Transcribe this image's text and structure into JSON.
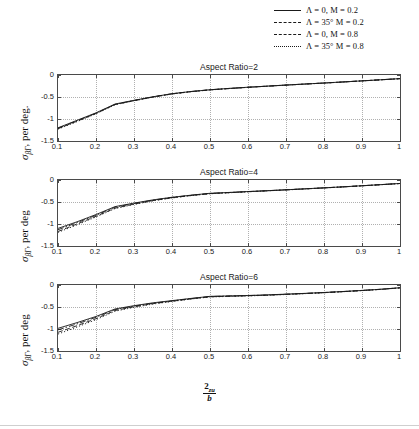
{
  "legend": {
    "position": "top-right",
    "entries": [
      {
        "label": "Λ = 0,   M = 0.2",
        "style": "solid"
      },
      {
        "label": "Λ = 35° M = 0.2",
        "style": "dashed"
      },
      {
        "label": "Λ = 0,   M = 0.8",
        "style": "dashdot"
      },
      {
        "label": "Λ = 35° M = 0.8",
        "style": "dotted"
      }
    ]
  },
  "axis": {
    "ylabel": "σβΓ, per deg.",
    "xlabel_numerator": "2z_u",
    "xlabel_denominator": "b",
    "xticklabels": [
      "0.1",
      "0.2",
      "0.3",
      "0.4",
      "0.5",
      "0.6",
      "0.7",
      "0.8",
      "0.9",
      "1"
    ],
    "yticklabels": [
      "0",
      "-0.5",
      "-1",
      "-1.5"
    ]
  },
  "chart_data": [
    {
      "type": "line",
      "title": "Aspect Ratio=2",
      "xlabel": "2z_u/b",
      "ylabel": "σβΓ, per deg.",
      "xlim": [
        0.1,
        1.0
      ],
      "ylim": [
        -1.5,
        0
      ],
      "xticks": [
        0.1,
        0.2,
        0.3,
        0.4,
        0.5,
        0.6,
        0.7,
        0.8,
        0.9,
        1.0
      ],
      "yticks": [
        0,
        -0.5,
        -1,
        -1.5
      ],
      "grid": true,
      "legend_position": "figure-top-right",
      "x": [
        0.1,
        0.15,
        0.2,
        0.25,
        0.3,
        0.35,
        0.4,
        0.45,
        0.5,
        0.55,
        0.6,
        0.65,
        0.7,
        0.75,
        0.8,
        0.85,
        0.9,
        0.95,
        1.0
      ],
      "series": [
        {
          "name": "Λ = 0,   M = 0.2",
          "style": "solid",
          "values": [
            -1.2,
            -1.03,
            -0.86,
            -0.66,
            -0.575,
            -0.495,
            -0.425,
            -0.375,
            -0.335,
            -0.305,
            -0.278,
            -0.253,
            -0.228,
            -0.205,
            -0.182,
            -0.158,
            -0.133,
            -0.108,
            -0.082
          ]
        },
        {
          "name": "Λ = 35° M = 0.2",
          "style": "dashed",
          "values": [
            -1.22,
            -1.05,
            -0.875,
            -0.672,
            -0.583,
            -0.5,
            -0.43,
            -0.378,
            -0.338,
            -0.308,
            -0.28,
            -0.255,
            -0.23,
            -0.206,
            -0.183,
            -0.159,
            -0.134,
            -0.109,
            -0.083
          ]
        },
        {
          "name": "Λ = 0,   M = 0.8",
          "style": "dashdot",
          "values": [
            -1.21,
            -1.04,
            -0.868,
            -0.668,
            -0.579,
            -0.497,
            -0.427,
            -0.376,
            -0.336,
            -0.306,
            -0.279,
            -0.254,
            -0.229,
            -0.205,
            -0.182,
            -0.158,
            -0.133,
            -0.108,
            -0.082
          ]
        },
        {
          "name": "Λ = 35° M = 0.8",
          "style": "dotted",
          "values": [
            -1.23,
            -1.06,
            -0.882,
            -0.676,
            -0.586,
            -0.503,
            -0.432,
            -0.38,
            -0.34,
            -0.309,
            -0.281,
            -0.256,
            -0.231,
            -0.207,
            -0.184,
            -0.16,
            -0.135,
            -0.11,
            -0.084
          ]
        }
      ]
    },
    {
      "type": "line",
      "title": "Aspect Ratio=4",
      "xlabel": "2z_u/b",
      "ylabel": "σβΓ, per deg",
      "xlim": [
        0.1,
        1.0
      ],
      "ylim": [
        -1.5,
        0
      ],
      "xticks": [
        0.1,
        0.2,
        0.3,
        0.4,
        0.5,
        0.6,
        0.7,
        0.8,
        0.9,
        1.0
      ],
      "yticks": [
        0,
        -0.5,
        -1,
        -1.5
      ],
      "grid": true,
      "x": [
        0.1,
        0.15,
        0.2,
        0.25,
        0.3,
        0.35,
        0.4,
        0.45,
        0.5,
        0.55,
        0.6,
        0.65,
        0.7,
        0.75,
        0.8,
        0.85,
        0.9,
        0.95,
        1.0
      ],
      "series": [
        {
          "name": "Λ = 0,   M = 0.2",
          "style": "solid",
          "values": [
            -1.1,
            -0.95,
            -0.785,
            -0.605,
            -0.525,
            -0.452,
            -0.392,
            -0.345,
            -0.302,
            -0.283,
            -0.262,
            -0.243,
            -0.222,
            -0.2,
            -0.178,
            -0.155,
            -0.13,
            -0.105,
            -0.078
          ]
        },
        {
          "name": "Λ = 35° M = 0.2",
          "style": "dashed",
          "values": [
            -1.17,
            -1.0,
            -0.825,
            -0.64,
            -0.548,
            -0.468,
            -0.404,
            -0.352,
            -0.31,
            -0.288,
            -0.266,
            -0.246,
            -0.225,
            -0.202,
            -0.18,
            -0.157,
            -0.132,
            -0.106,
            -0.08
          ]
        },
        {
          "name": "Λ = 0,   M = 0.8",
          "style": "dashdot",
          "values": [
            -1.13,
            -0.97,
            -0.802,
            -0.618,
            -0.534,
            -0.458,
            -0.396,
            -0.348,
            -0.305,
            -0.285,
            -0.264,
            -0.244,
            -0.223,
            -0.201,
            -0.179,
            -0.156,
            -0.131,
            -0.105,
            -0.079
          ]
        },
        {
          "name": "Λ = 35° M = 0.8",
          "style": "dotted",
          "values": [
            -1.19,
            -1.02,
            -0.84,
            -0.65,
            -0.556,
            -0.473,
            -0.408,
            -0.355,
            -0.313,
            -0.29,
            -0.268,
            -0.247,
            -0.226,
            -0.203,
            -0.181,
            -0.158,
            -0.133,
            -0.107,
            -0.081
          ]
        }
      ]
    },
    {
      "type": "line",
      "title": "Aspect Ratio=6",
      "xlabel": "2z_u/b",
      "ylabel": "σβΓ, per deg",
      "xlim": [
        0.1,
        1.0
      ],
      "ylim": [
        -1.5,
        0
      ],
      "xticks": [
        0.1,
        0.2,
        0.3,
        0.4,
        0.5,
        0.6,
        0.7,
        0.8,
        0.9,
        1.0
      ],
      "yticks": [
        0,
        -0.5,
        -1,
        -1.5
      ],
      "grid": true,
      "x": [
        0.1,
        0.15,
        0.2,
        0.25,
        0.3,
        0.35,
        0.4,
        0.45,
        0.5,
        0.55,
        0.6,
        0.65,
        0.7,
        0.75,
        0.8,
        0.85,
        0.9,
        0.95,
        1.0
      ],
      "series": [
        {
          "name": "Λ = 0,   M = 0.2",
          "style": "solid",
          "values": [
            -0.985,
            -0.855,
            -0.715,
            -0.545,
            -0.47,
            -0.405,
            -0.355,
            -0.305,
            -0.258,
            -0.248,
            -0.238,
            -0.225,
            -0.208,
            -0.19,
            -0.17,
            -0.148,
            -0.123,
            -0.096,
            -0.062
          ]
        },
        {
          "name": "Λ = 35° M = 0.2",
          "style": "dashed",
          "values": [
            -1.075,
            -0.925,
            -0.765,
            -0.58,
            -0.495,
            -0.424,
            -0.368,
            -0.315,
            -0.268,
            -0.256,
            -0.245,
            -0.231,
            -0.213,
            -0.194,
            -0.174,
            -0.151,
            -0.126,
            -0.099,
            -0.065
          ]
        },
        {
          "name": "Λ = 0,   M = 0.8",
          "style": "dashdot",
          "values": [
            -1.02,
            -0.885,
            -0.735,
            -0.56,
            -0.481,
            -0.414,
            -0.361,
            -0.31,
            -0.262,
            -0.251,
            -0.241,
            -0.228,
            -0.21,
            -0.192,
            -0.172,
            -0.149,
            -0.124,
            -0.097,
            -0.063
          ]
        },
        {
          "name": "Λ = 35° M = 0.8",
          "style": "dotted",
          "values": [
            -1.115,
            -0.955,
            -0.788,
            -0.596,
            -0.507,
            -0.433,
            -0.374,
            -0.319,
            -0.272,
            -0.259,
            -0.248,
            -0.234,
            -0.216,
            -0.196,
            -0.176,
            -0.153,
            -0.128,
            -0.1,
            -0.066
          ]
        }
      ]
    }
  ],
  "colors": {
    "line": "#1a1a1a",
    "grid": "#b0b0b0",
    "axis": "#4a4a4a",
    "background": "#ffffff"
  }
}
